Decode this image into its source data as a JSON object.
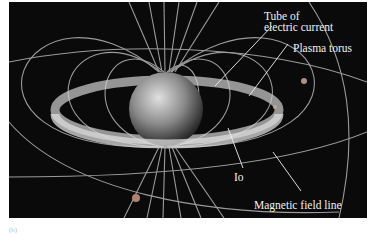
{
  "figure": {
    "labels": {
      "tube_line1": "Tube of",
      "tube_line2": "electric current",
      "plasma_torus": "Plasma torus",
      "io": "Io",
      "magnetic_field_line": "Magnetic field line"
    },
    "panel_label": "(b)",
    "colors": {
      "background": "#0a0a0a",
      "field_lines": "#bfbfbf",
      "planet": "#9a9a9a",
      "label_text": "#f2f2f2"
    }
  }
}
